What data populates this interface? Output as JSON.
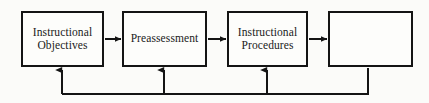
{
  "diagram": {
    "type": "flowchart",
    "background_color": "#fbfbf9",
    "line_color": "#141414",
    "text_color": "#1a1a1a",
    "nodes": [
      {
        "id": "instructional-objectives",
        "label": "Instructional\nObjectives",
        "x": 21,
        "y": 11,
        "width": 83,
        "height": 56
      },
      {
        "id": "preassessment",
        "label": "Preassessment",
        "x": 122,
        "y": 11,
        "width": 85,
        "height": 56
      },
      {
        "id": "instructional-procedures",
        "label": "Instructional\nProcedures",
        "x": 227,
        "y": 11,
        "width": 81,
        "height": 56
      },
      {
        "id": "evaluation",
        "label": "",
        "x": 328,
        "y": 11,
        "width": 85,
        "height": 56
      }
    ],
    "forward_arrows": [
      {
        "id": "objectives-to-preassessment",
        "from": "instructional-objectives",
        "to": "preassessment"
      },
      {
        "id": "preassessment-to-procedures",
        "from": "preassessment",
        "to": "instructional-procedures"
      },
      {
        "id": "procedures-to-evaluation",
        "from": "instructional-procedures",
        "to": "evaluation"
      }
    ],
    "feedback_loop": {
      "id": "feedback-loop",
      "source": "evaluation",
      "bus_y": 94,
      "targets": [
        {
          "id": "feedback-to-objectives",
          "to": "instructional-objectives",
          "x": 62
        },
        {
          "id": "feedback-to-preassessment",
          "to": "preassessment",
          "x": 164
        },
        {
          "id": "feedback-to-procedures",
          "to": "instructional-procedures",
          "x": 267
        }
      ]
    }
  }
}
